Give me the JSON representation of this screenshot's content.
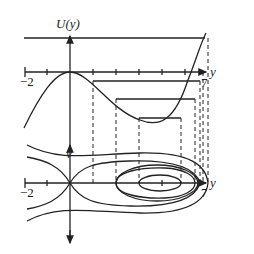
{
  "top_plot": {
    "ylabel": "U(y)",
    "xlabel": "y",
    "x_min_label": "−2",
    "x_max_label": "7",
    "levels": 4
  },
  "bottom_plot": {
    "ylabel": "v",
    "xlabel": "y",
    "x_min_label": "−2",
    "x_max_label": "7"
  },
  "colors": {
    "line": "#222222",
    "background": "#ffffff"
  }
}
